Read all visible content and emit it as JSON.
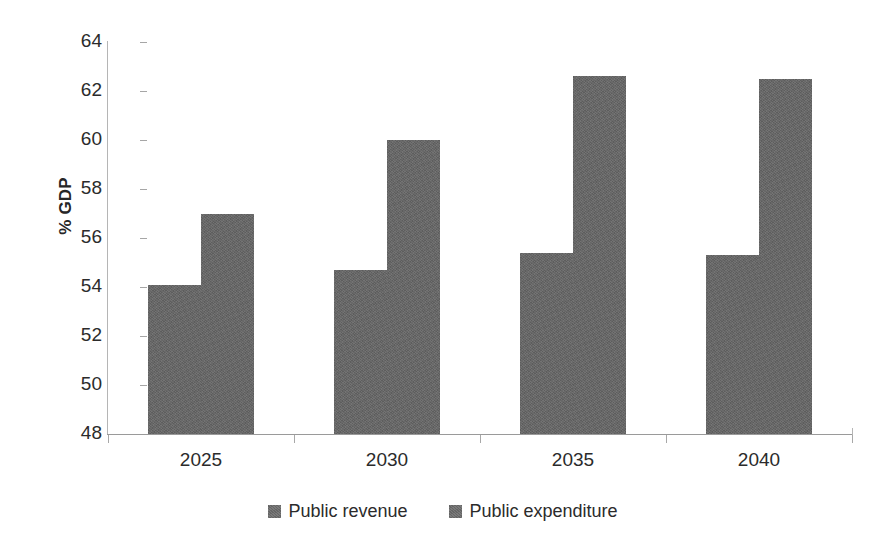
{
  "chart_data": {
    "type": "bar",
    "title": "",
    "xlabel": "",
    "ylabel": "% GDP",
    "categories": [
      "2025",
      "2030",
      "2035",
      "2040"
    ],
    "series": [
      {
        "name": "Public revenue",
        "values": [
          54.1,
          54.7,
          55.4,
          55.3
        ]
      },
      {
        "name": "Public expenditure",
        "values": [
          57.0,
          60.0,
          62.6,
          62.5
        ]
      }
    ],
    "ylim": [
      48,
      64
    ],
    "ytick_labels": [
      "64",
      "62",
      "60",
      "58",
      "56",
      "54",
      "52",
      "50",
      "48"
    ],
    "ytick_values": [
      64,
      62,
      60,
      58,
      56,
      54,
      52,
      50,
      48
    ],
    "grid": false,
    "legend_position": "bottom",
    "series_color": "#666666"
  },
  "axis": {
    "y_title": "% GDP"
  },
  "legend": {
    "items": [
      {
        "label": "Public revenue"
      },
      {
        "label": "Public expenditure"
      }
    ]
  }
}
